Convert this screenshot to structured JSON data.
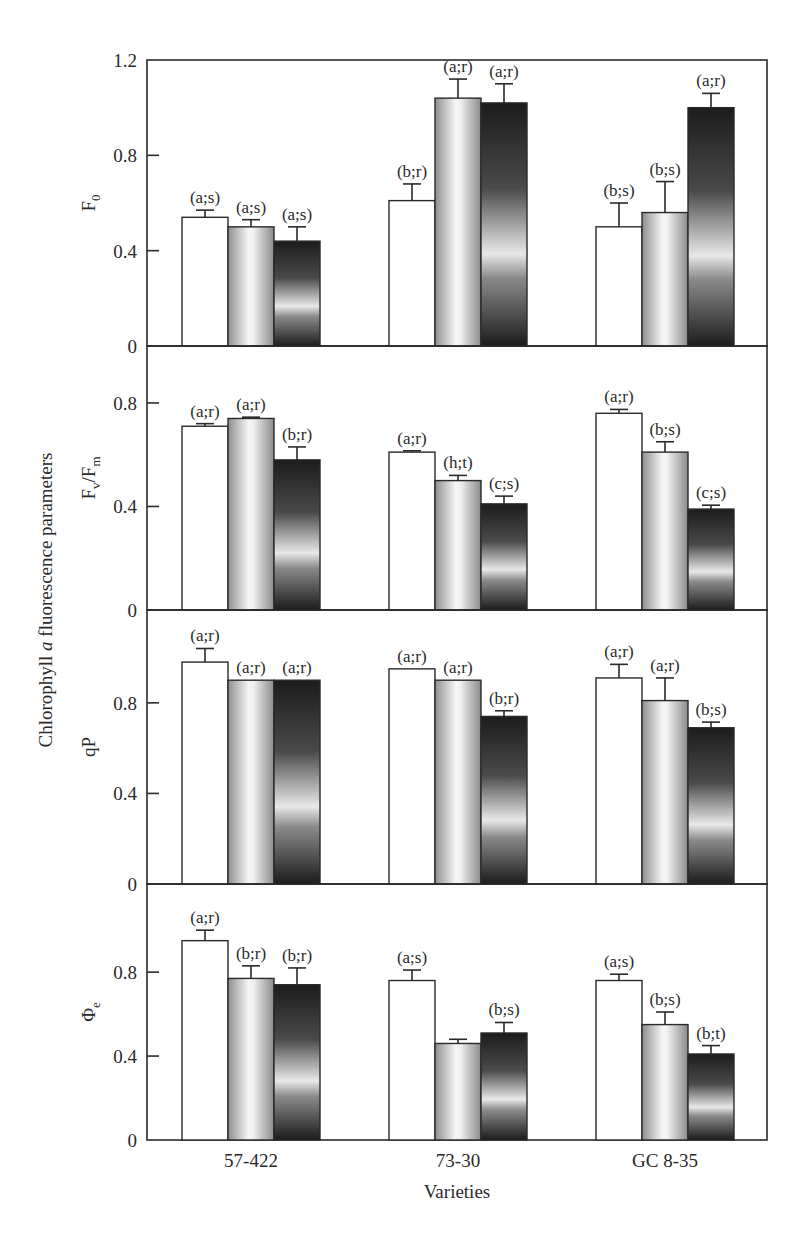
{
  "chart_data": {
    "type": "bar",
    "title": "",
    "ylabel": "Chlorophyll a fluorescence parameters",
    "ylabel_parts": {
      "before": "Chlorophyll ",
      "italic": "a",
      "after": " fluorescence parameters"
    },
    "xlabel": "Varieties",
    "categories": [
      "57-422",
      "73-30",
      "GC 8-35"
    ],
    "series_styles": [
      "white",
      "light-grey-gradient",
      "dark-gradient"
    ],
    "colors": {
      "frame": "#2a2a2a",
      "white_bar": "#ffffff",
      "grey_light": "#f4f4f4",
      "grey_mid": "#9a9a9a",
      "dark": "#1e1e1e",
      "dark_mid": "#7a7a7a"
    },
    "grid": false,
    "legend": null,
    "panels": [
      {
        "ylabel": "F0",
        "ylabel_main": "F",
        "ylabel_sub": "0",
        "ylim": [
          0,
          1.2
        ],
        "yticks": [
          "0",
          "0.4",
          "0.8",
          "1.2"
        ],
        "ytick_values": [
          0,
          0.4,
          0.8,
          1.2
        ],
        "groups": [
          {
            "category": "57-422",
            "values": [
              0.54,
              0.5,
              0.44
            ],
            "errors": [
              0.03,
              0.03,
              0.06
            ],
            "labels": [
              "(a;s)",
              "(a;s)",
              "(a;s)"
            ]
          },
          {
            "category": "73-30",
            "values": [
              0.61,
              1.04,
              1.02
            ],
            "errors": [
              0.07,
              0.08,
              0.08
            ],
            "labels": [
              "(b;r)",
              "(a;r)",
              "(a;r)"
            ]
          },
          {
            "category": "GC 8-35",
            "values": [
              0.5,
              0.56,
              1.0
            ],
            "errors": [
              0.1,
              0.13,
              0.06
            ],
            "labels": [
              "(b;s)",
              "(b;s)",
              "(a;r)"
            ]
          }
        ]
      },
      {
        "ylabel": "Fv/Fm",
        "ylabel_main": "F",
        "ylabel_sub": "v",
        "ylabel_main2": "/F",
        "ylabel_sub2": "m",
        "ylim": [
          0,
          1.02
        ],
        "yticks": [
          "0",
          "0.4",
          "0.8"
        ],
        "ytick_values": [
          0,
          0.4,
          0.8
        ],
        "groups": [
          {
            "category": "57-422",
            "values": [
              0.71,
              0.74,
              0.58
            ],
            "errors": [
              0.01,
              0.005,
              0.05
            ],
            "labels": [
              "(a;r)",
              "(a;r)",
              "(b;r)"
            ]
          },
          {
            "category": "73-30",
            "values": [
              0.61,
              0.5,
              0.41
            ],
            "errors": [
              0.005,
              0.02,
              0.03
            ],
            "labels": [
              "(a;r)",
              "(h;t)",
              "(c;s)"
            ]
          },
          {
            "category": "GC 8-35",
            "values": [
              0.76,
              0.61,
              0.39
            ],
            "errors": [
              0.015,
              0.04,
              0.015
            ],
            "labels": [
              "(a;r)",
              "(b;s)",
              "(c;s)"
            ]
          }
        ]
      },
      {
        "ylabel": "qP",
        "ylabel_main": "qP",
        "ylim": [
          0,
          1.21
        ],
        "yticks": [
          "0",
          "0.4",
          "0.8"
        ],
        "ytick_values": [
          0,
          0.4,
          0.8
        ],
        "groups": [
          {
            "category": "57-422",
            "values": [
              0.98,
              0.9,
              0.9
            ],
            "errors": [
              0.06,
              0,
              0
            ],
            "labels": [
              "(a;r)",
              "(a;r)",
              "(a;r)"
            ]
          },
          {
            "category": "73-30",
            "values": [
              0.95,
              0.9,
              0.74
            ],
            "errors": [
              0,
              0,
              0.025
            ],
            "labels": [
              "(a;r)",
              "(a;r)",
              "(b;r)"
            ]
          },
          {
            "category": "GC 8-35",
            "values": [
              0.91,
              0.81,
              0.69
            ],
            "errors": [
              0.06,
              0.1,
              0.025
            ],
            "labels": [
              "(a;r)",
              "(a;r)",
              "(b;s)"
            ]
          }
        ]
      },
      {
        "ylabel": "Φe",
        "ylabel_main": "Φ",
        "ylabel_sub": "e",
        "ylim": [
          0,
          1.22
        ],
        "yticks": [
          "0",
          "0.4",
          "0.8"
        ],
        "ytick_values": [
          0,
          0.4,
          0.8
        ],
        "groups": [
          {
            "category": "57-422",
            "values": [
              0.95,
              0.77,
              0.74
            ],
            "errors": [
              0.05,
              0.06,
              0.08
            ],
            "labels": [
              "(a;r)",
              "(b;r)",
              "(b;r)"
            ]
          },
          {
            "category": "73-30",
            "values": [
              0.76,
              0.46,
              0.51
            ],
            "errors": [
              0.05,
              0.02,
              0.05
            ],
            "labels": [
              "(a;s)",
              "",
              "(b;s)"
            ]
          },
          {
            "category": "GC 8-35",
            "values": [
              0.76,
              0.55,
              0.41
            ],
            "errors": [
              0.03,
              0.06,
              0.04
            ],
            "labels": [
              "(a;s)",
              "(b;s)",
              "(b;t)"
            ]
          }
        ]
      }
    ]
  }
}
